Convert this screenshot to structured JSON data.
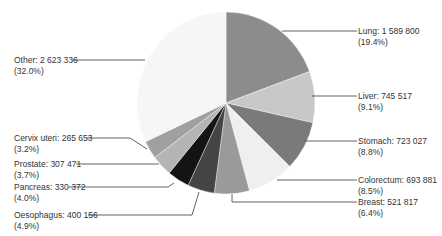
{
  "chart_data": {
    "type": "pie",
    "title": "",
    "start_angle_deg": 0,
    "direction": "clockwise",
    "slices": [
      {
        "name": "Lung",
        "value": 1589800,
        "percent": 19.4,
        "value_label": "1 589 800",
        "percent_label": "(19.4%)",
        "color": "#8c8c8c"
      },
      {
        "name": "Liver",
        "value": 745517,
        "percent": 9.1,
        "value_label": "745 517",
        "percent_label": "(9.1%)",
        "color": "#c8c8c8"
      },
      {
        "name": "Stomach",
        "value": 723027,
        "percent": 8.8,
        "value_label": "723 027",
        "percent_label": "(8.8%)",
        "color": "#7a7a7a"
      },
      {
        "name": "Colorectum",
        "value": 693881,
        "percent": 8.5,
        "value_label": "693 881",
        "percent_label": "(8.5%)",
        "color": "#efefef"
      },
      {
        "name": "Breast",
        "value": 521817,
        "percent": 6.4,
        "value_label": "521 817",
        "percent_label": "(6.4%)",
        "color": "#9a9a9a"
      },
      {
        "name": "Oesophagus",
        "value": 400156,
        "percent": 4.9,
        "value_label": "400 156",
        "percent_label": "(4.9%)",
        "color": "#444444"
      },
      {
        "name": "Pancreas",
        "value": 330372,
        "percent": 4.0,
        "value_label": "330 372",
        "percent_label": "(4.0%)",
        "color": "#141414"
      },
      {
        "name": "Prostate",
        "value": 307471,
        "percent": 3.7,
        "value_label": "307 471",
        "percent_label": "(3.7%)",
        "color": "#b4b4b4"
      },
      {
        "name": "Cervix uteri",
        "value": 265653,
        "percent": 3.2,
        "value_label": "265 653",
        "percent_label": "(3.2%)",
        "color": "#a0a0a0"
      },
      {
        "name": "Other",
        "value": 2623336,
        "percent": 32.0,
        "value_label": "2 623 336",
        "percent_label": "(32.0%)",
        "color": "#f6f6f6"
      }
    ],
    "legend": "none (callout labels with leader lines)"
  },
  "labels": {
    "lung": {
      "line1": "Lung: 1 589 800",
      "line2": "(19.4%)"
    },
    "liver": {
      "line1": "Liver: 745 517",
      "line2": "(9.1%)"
    },
    "stomach": {
      "line1": "Stomach: 723 027",
      "line2": "(8.8%)"
    },
    "colorectum": {
      "line1": "Colorectum: 693 881",
      "line2": "(8.5%)"
    },
    "breast": {
      "line1": "Breast: 521 817",
      "line2": "(6.4%)"
    },
    "oesophagus": {
      "line1": "Oesophagus: 400 156",
      "line2": "(4.9%)"
    },
    "pancreas": {
      "line1": "Pancreas: 330 372",
      "line2": "(4.0%)"
    },
    "prostate": {
      "line1": "Prostate: 307 471",
      "line2": "(3.7%)"
    },
    "cervix": {
      "line1": "Cervix uteri: 265 653",
      "line2": "(3.2%)"
    },
    "other": {
      "line1": "Other: 2 623 336",
      "line2": "(32.0%)"
    }
  }
}
